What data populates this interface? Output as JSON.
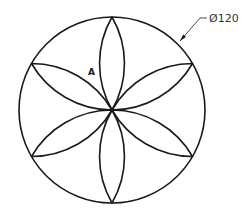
{
  "diagram": {
    "type": "geometric-construction",
    "outer_circle": {
      "cx": 112,
      "cy": 110,
      "r": 93
    },
    "petals": {
      "count": 6,
      "angles_deg": [
        0,
        60,
        120,
        180,
        240,
        300
      ]
    },
    "region_label": {
      "text": "A",
      "x": 88,
      "y": 75
    },
    "dimension": {
      "text": "Ø120",
      "x": 209,
      "y": 22
    },
    "leader": {
      "arrow_tip": [
        180,
        41
      ],
      "elbow": [
        200,
        18
      ],
      "end": [
        207,
        18
      ]
    },
    "colors": {
      "line": "#1a1a1a",
      "background": "#ffffff"
    }
  }
}
